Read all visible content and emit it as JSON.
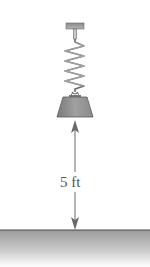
{
  "figure": {
    "dimension_label": "5 ft",
    "components": [
      "ceiling-mount",
      "spring",
      "weight",
      "dimension-arrow",
      "ground"
    ]
  },
  "colors": {
    "line": "#6a6a6a",
    "weight_fill": "#8c8c8c",
    "ground_fill": "#b0b0b0",
    "ground_line": "#4a4a4a"
  }
}
